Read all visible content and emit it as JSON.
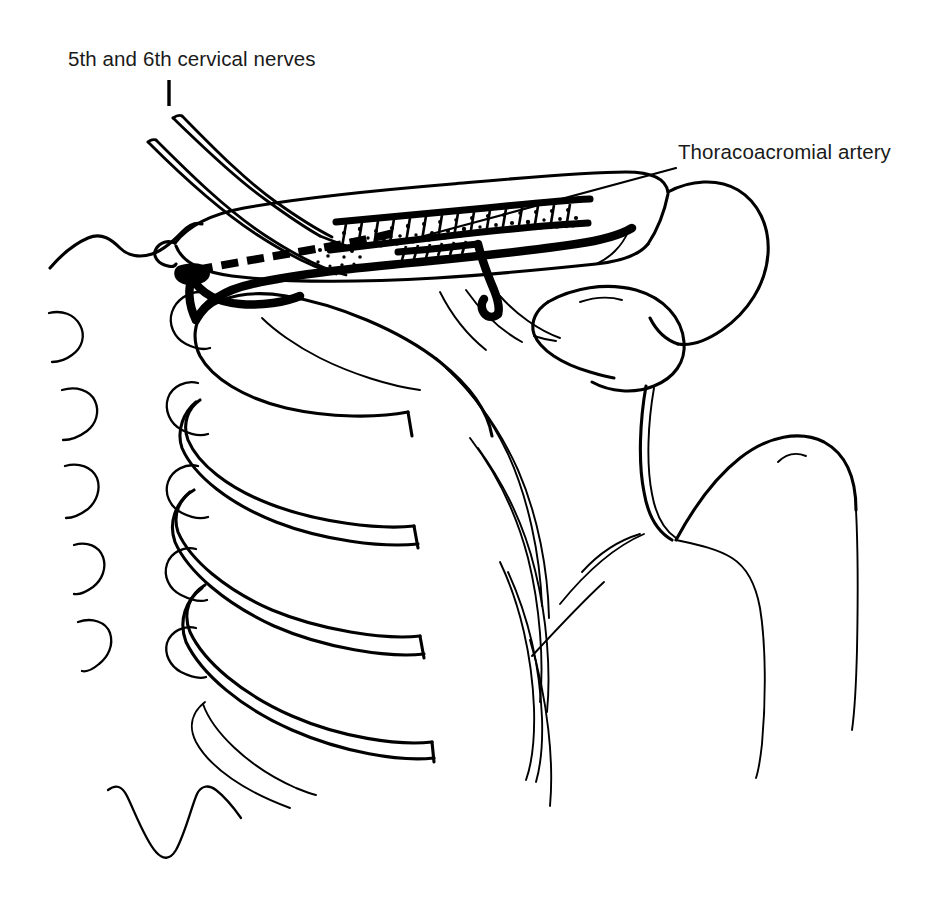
{
  "figure": {
    "kind": "anatomical-line-drawing",
    "background_color": "#ffffff",
    "ink_color": "#000000",
    "width": 943,
    "height": 902
  },
  "labels": [
    {
      "id": "cervical-nerves",
      "text": "5th and 6th cervical nerves",
      "x": 68,
      "y": 66,
      "leader": "vertical-tick",
      "leader_from": [
        169,
        80
      ],
      "leader_to": [
        169,
        106
      ]
    },
    {
      "id": "thoracoacromial-artery",
      "text": "Thoracoacromial artery",
      "x": 678,
      "y": 159,
      "leader": "diagonal",
      "leader_from": [
        676,
        168
      ],
      "leader_to": [
        424,
        236
      ]
    }
  ],
  "structures": [
    {
      "name": "vertebral-column",
      "type": "bone",
      "count_spinous_left": 5,
      "count_spinous_right": 5
    },
    {
      "name": "ribs",
      "type": "bone",
      "count": 6
    },
    {
      "name": "clavicle",
      "type": "bone"
    },
    {
      "name": "scapula-acromion",
      "type": "bone"
    },
    {
      "name": "coracoid-process",
      "type": "bone"
    },
    {
      "name": "humerus",
      "type": "bone"
    },
    {
      "name": "brachial-plexus-roots",
      "type": "nerve",
      "roots": [
        "C5",
        "C6"
      ]
    },
    {
      "name": "brachial-plexus-trunk",
      "type": "nerve",
      "render": "stippled-band"
    },
    {
      "name": "subclavian-artery",
      "type": "vessel",
      "render": "solid-thick-black"
    },
    {
      "name": "subclavian-vein",
      "type": "vessel",
      "render": "dashed-thick-black"
    },
    {
      "name": "thoracoacromial-artery",
      "type": "vessel",
      "render": "solid-thick-black-with-descending-branch"
    }
  ]
}
